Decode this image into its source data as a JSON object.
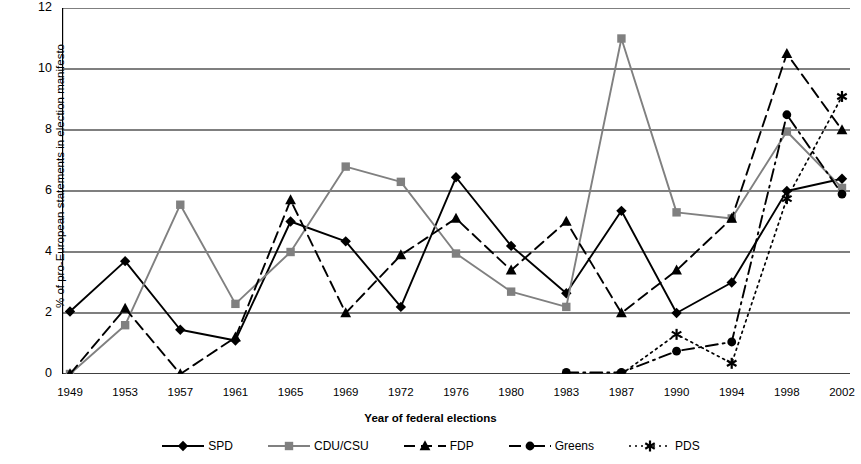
{
  "chart_data": {
    "type": "line",
    "title": "",
    "xlabel": "Year of federal elections",
    "ylabel": "% of pro-European statements in election manifesto",
    "categories": [
      "1949",
      "1953",
      "1957",
      "1961",
      "1965",
      "1969",
      "1972",
      "1976",
      "1980",
      "1983",
      "1987",
      "1990",
      "1994",
      "1998",
      "2002"
    ],
    "ylim": [
      0,
      12
    ],
    "yticks": [
      0,
      2,
      4,
      6,
      8,
      10,
      12
    ],
    "grid": true,
    "legend_position": "bottom",
    "series": [
      {
        "name": "SPD",
        "marker": "diamond",
        "line_style": "solid",
        "color": "#000000",
        "values": [
          2.05,
          3.7,
          1.45,
          1.1,
          5.0,
          4.35,
          2.2,
          6.45,
          4.2,
          2.65,
          5.35,
          2.0,
          3.0,
          6.0,
          6.4
        ]
      },
      {
        "name": "CDU/CSU",
        "marker": "square",
        "line_style": "solid",
        "color": "#808080",
        "values": [
          0.0,
          1.6,
          5.55,
          2.3,
          4.0,
          6.8,
          6.3,
          3.95,
          2.7,
          2.2,
          11.0,
          5.3,
          5.1,
          7.95,
          6.1
        ]
      },
      {
        "name": "FDP",
        "marker": "triangle",
        "line_style": "dashed",
        "color": "#000000",
        "values": [
          0.0,
          2.15,
          0.0,
          1.2,
          5.7,
          2.0,
          3.9,
          5.1,
          3.4,
          5.0,
          2.0,
          3.4,
          5.1,
          10.5,
          8.0
        ]
      },
      {
        "name": "Greens",
        "marker": "circle",
        "line_style": "dashdot",
        "color": "#000000",
        "values": [
          null,
          null,
          null,
          null,
          null,
          null,
          null,
          null,
          null,
          0.05,
          0.05,
          0.75,
          1.05,
          8.5,
          5.9
        ]
      },
      {
        "name": "PDS",
        "marker": "asterisk",
        "line_style": "dotted",
        "color": "#000000",
        "values": [
          null,
          null,
          null,
          null,
          null,
          null,
          null,
          null,
          null,
          null,
          0.0,
          1.3,
          0.35,
          5.75,
          9.1
        ]
      }
    ]
  }
}
